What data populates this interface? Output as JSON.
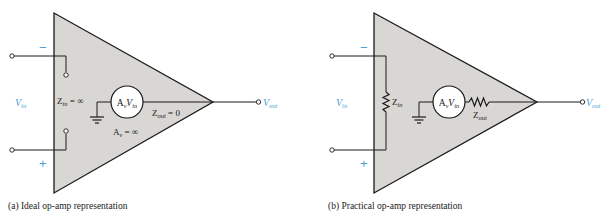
{
  "colors": {
    "amp_fill": "#d9d7d3",
    "stroke": "#1a1a1a",
    "accent_blue": "#4a9fd8"
  },
  "diagram_a": {
    "caption": "(a) Ideal op-amp representation",
    "minus_sign": "−",
    "plus_sign": "+",
    "vin_label_main": "V",
    "vin_label_sub": "in",
    "vout_label_main": "V",
    "vout_label_sub": "out",
    "zin_main": "Z",
    "zin_sub": "in",
    "zin_value": " = ∞",
    "source_a": "A",
    "source_a_sub": "v",
    "source_v": "V",
    "source_v_sub": "in",
    "zout_main": "Z",
    "zout_sub": "out",
    "zout_value": " = 0",
    "av_main": "A",
    "av_sub": "v",
    "av_value": " = ∞"
  },
  "diagram_b": {
    "caption": "(b) Practical op-amp representation",
    "minus_sign": "−",
    "plus_sign": "+",
    "vin_label_main": "V",
    "vin_label_sub": "in",
    "vout_label_main": "V",
    "vout_label_sub": "out",
    "zin_main": "Z",
    "zin_sub": "in",
    "source_a": "A",
    "source_a_sub": "v",
    "source_v": "V",
    "source_v_sub": "in",
    "zout_main": "Z",
    "zout_sub": "out"
  }
}
